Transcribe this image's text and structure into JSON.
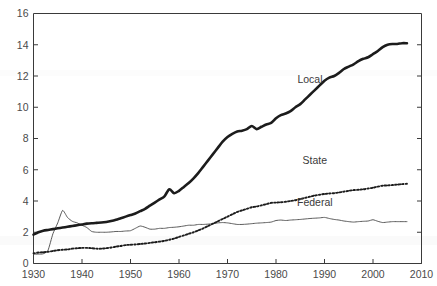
{
  "chart_data": {
    "type": "line",
    "title": "",
    "subtitle": "",
    "xlabel": "",
    "ylabel": "",
    "xlim": [
      1930,
      2010
    ],
    "ylim": [
      0,
      16
    ],
    "grid": false,
    "legend_position": "inline-annotations",
    "yticks": [
      0,
      2,
      4,
      6,
      8,
      10,
      12,
      14,
      16
    ],
    "ytick_labels": [
      "0",
      "2",
      "4",
      "6",
      "8",
      "10",
      "12",
      "14",
      "16"
    ],
    "xticks": [
      1930,
      1940,
      1950,
      1960,
      1970,
      1980,
      1990,
      2000,
      2010
    ],
    "xtick_labels": [
      "1930",
      "1940",
      "1950",
      "1960",
      "1970",
      "1980",
      "1990",
      "2000",
      "2010"
    ],
    "annotations": [
      {
        "text": "Local",
        "x": 1987,
        "y": 11.55
      },
      {
        "text": "State",
        "x": 1988,
        "y": 6.35
      },
      {
        "text": "Federal",
        "x": 1988,
        "y": 3.65
      }
    ],
    "series": [
      {
        "name": "Local",
        "style": "thick-solid",
        "color": "#1c1c1c",
        "x": [
          1930,
          1931,
          1932,
          1933,
          1934,
          1935,
          1936,
          1937,
          1938,
          1939,
          1940,
          1941,
          1942,
          1943,
          1944,
          1945,
          1946,
          1947,
          1948,
          1949,
          1950,
          1951,
          1952,
          1953,
          1954,
          1955,
          1956,
          1957,
          1958,
          1959,
          1960,
          1961,
          1962,
          1963,
          1964,
          1965,
          1966,
          1967,
          1968,
          1969,
          1970,
          1971,
          1972,
          1973,
          1974,
          1975,
          1976,
          1977,
          1978,
          1979,
          1980,
          1981,
          1982,
          1983,
          1984,
          1985,
          1986,
          1987,
          1988,
          1989,
          1990,
          1991,
          1992,
          1993,
          1994,
          1995,
          1996,
          1997,
          1998,
          1999,
          2000,
          2001,
          2002,
          2003,
          2004,
          2005,
          2006,
          2007
        ],
        "values": [
          1.85,
          2.0,
          2.1,
          2.15,
          2.2,
          2.25,
          2.3,
          2.35,
          2.4,
          2.45,
          2.5,
          2.55,
          2.58,
          2.6,
          2.62,
          2.66,
          2.72,
          2.8,
          2.9,
          3.0,
          3.1,
          3.2,
          3.35,
          3.5,
          3.7,
          3.9,
          4.1,
          4.3,
          4.75,
          4.5,
          4.65,
          4.9,
          5.15,
          5.45,
          5.8,
          6.2,
          6.6,
          7.0,
          7.4,
          7.8,
          8.1,
          8.3,
          8.45,
          8.5,
          8.6,
          8.8,
          8.6,
          8.75,
          8.9,
          9.0,
          9.3,
          9.5,
          9.6,
          9.75,
          10.0,
          10.2,
          10.5,
          10.8,
          11.1,
          11.4,
          11.7,
          11.9,
          12.0,
          12.2,
          12.45,
          12.6,
          12.75,
          12.95,
          13.1,
          13.2,
          13.4,
          13.6,
          13.85,
          14.0,
          14.05,
          14.05,
          14.1,
          14.1
        ]
      },
      {
        "name": "State",
        "style": "dotted",
        "color": "#1c1c1c",
        "x": [
          1930,
          1931,
          1932,
          1933,
          1934,
          1935,
          1936,
          1937,
          1938,
          1939,
          1940,
          1941,
          1942,
          1943,
          1944,
          1945,
          1946,
          1947,
          1948,
          1949,
          1950,
          1951,
          1952,
          1953,
          1954,
          1955,
          1956,
          1957,
          1958,
          1959,
          1960,
          1961,
          1962,
          1963,
          1964,
          1965,
          1966,
          1967,
          1968,
          1969,
          1970,
          1971,
          1972,
          1973,
          1974,
          1975,
          1976,
          1977,
          1978,
          1979,
          1980,
          1981,
          1982,
          1983,
          1984,
          1985,
          1986,
          1987,
          1988,
          1989,
          1990,
          1991,
          1992,
          1993,
          1994,
          1995,
          1996,
          1997,
          1998,
          1999,
          2000,
          2001,
          2002,
          2003,
          2004,
          2005,
          2006,
          2007
        ],
        "values": [
          0.65,
          0.7,
          0.72,
          0.75,
          0.8,
          0.85,
          0.88,
          0.9,
          0.95,
          0.98,
          1.0,
          1.0,
          0.98,
          0.95,
          0.95,
          0.98,
          1.02,
          1.08,
          1.12,
          1.18,
          1.2,
          1.22,
          1.25,
          1.28,
          1.32,
          1.36,
          1.4,
          1.45,
          1.52,
          1.6,
          1.7,
          1.8,
          1.9,
          2.0,
          2.12,
          2.25,
          2.4,
          2.55,
          2.7,
          2.85,
          3.0,
          3.15,
          3.3,
          3.4,
          3.5,
          3.6,
          3.65,
          3.72,
          3.8,
          3.88,
          3.9,
          3.92,
          3.95,
          4.0,
          4.05,
          4.12,
          4.2,
          4.28,
          4.35,
          4.4,
          4.45,
          4.48,
          4.5,
          4.55,
          4.6,
          4.65,
          4.7,
          4.72,
          4.75,
          4.8,
          4.85,
          4.92,
          4.98,
          5.0,
          5.02,
          5.05,
          5.08,
          5.1
        ]
      },
      {
        "name": "Federal",
        "style": "thin-solid",
        "color": "#5a5a5a",
        "x": [
          1930,
          1931,
          1932,
          1933,
          1934,
          1935,
          1936,
          1937,
          1938,
          1939,
          1940,
          1941,
          1942,
          1943,
          1944,
          1945,
          1946,
          1947,
          1948,
          1949,
          1950,
          1951,
          1952,
          1953,
          1954,
          1955,
          1956,
          1957,
          1958,
          1959,
          1960,
          1961,
          1962,
          1963,
          1964,
          1965,
          1966,
          1967,
          1968,
          1969,
          1970,
          1971,
          1972,
          1973,
          1974,
          1975,
          1976,
          1977,
          1978,
          1979,
          1980,
          1981,
          1982,
          1983,
          1984,
          1985,
          1986,
          1987,
          1988,
          1989,
          1990,
          1991,
          1992,
          1993,
          1994,
          1995,
          1996,
          1997,
          1998,
          1999,
          2000,
          2001,
          2002,
          2003,
          2004,
          2005,
          2006,
          2007
        ],
        "values": [
          0.6,
          0.6,
          0.62,
          0.85,
          1.9,
          2.6,
          3.4,
          2.95,
          2.7,
          2.6,
          2.45,
          2.3,
          2.05,
          2.0,
          2.0,
          2.0,
          2.02,
          2.05,
          2.05,
          2.08,
          2.1,
          2.25,
          2.4,
          2.32,
          2.2,
          2.2,
          2.25,
          2.25,
          2.3,
          2.32,
          2.35,
          2.4,
          2.45,
          2.45,
          2.5,
          2.5,
          2.52,
          2.55,
          2.6,
          2.62,
          2.6,
          2.55,
          2.5,
          2.5,
          2.52,
          2.55,
          2.58,
          2.6,
          2.62,
          2.65,
          2.75,
          2.78,
          2.75,
          2.78,
          2.8,
          2.82,
          2.85,
          2.88,
          2.9,
          2.92,
          2.95,
          2.88,
          2.82,
          2.78,
          2.72,
          2.68,
          2.65,
          2.68,
          2.7,
          2.72,
          2.8,
          2.7,
          2.62,
          2.65,
          2.68,
          2.68,
          2.68,
          2.68
        ]
      }
    ]
  }
}
